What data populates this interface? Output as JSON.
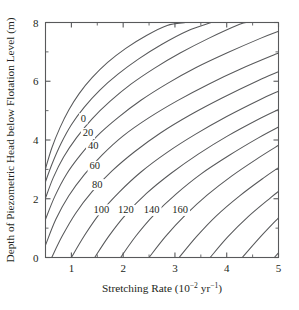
{
  "chart_data": {
    "type": "line",
    "title": "",
    "subtitle": "",
    "xlabel": "Stretching Rate (10⁻² yr⁻¹)",
    "xlabel_parts": {
      "text_main": "Stretching Rate (10",
      "exp1": "−2",
      "text_mid": " yr",
      "exp2": "−1",
      "text_end": ")"
    },
    "ylabel": "Depth of Piezometric Head below Flotation Level (m)",
    "xlim": [
      0.5,
      5.0
    ],
    "ylim": [
      0.0,
      8.0
    ],
    "x_ticks_major": [
      1,
      2,
      3,
      4,
      5
    ],
    "x_ticks_major_labels": [
      "1",
      "2",
      "3",
      "4",
      "5"
    ],
    "x_ticks_minor": [
      1.5,
      2.5,
      3.5,
      4.5
    ],
    "y_ticks_major": [
      0,
      2,
      4,
      6,
      8
    ],
    "y_ticks_major_labels": [
      "0",
      "2",
      "4",
      "6",
      "8"
    ],
    "y_ticks_minor": [
      1,
      3,
      5,
      7
    ],
    "grid": false,
    "legend": "none",
    "frame": "box-all-four-sides",
    "contour_interval": 20,
    "contour_labels": [
      "0",
      "20",
      "40",
      "60",
      "80",
      "100",
      "120",
      "140",
      "160"
    ],
    "series": [
      {
        "name": "0",
        "label": "0",
        "label_x": 1.23,
        "label_y": 4.62,
        "points": [
          [
            0.5,
            3.02
          ],
          [
            0.62,
            3.72
          ],
          [
            0.78,
            4.42
          ],
          [
            0.95,
            5.02
          ],
          [
            1.15,
            5.58
          ],
          [
            1.4,
            6.12
          ],
          [
            1.7,
            6.64
          ],
          [
            2.05,
            7.12
          ],
          [
            2.45,
            7.56
          ],
          [
            2.85,
            7.9
          ],
          [
            3.2,
            8.0
          ]
        ]
      },
      {
        "name": "20",
        "label": "20",
        "label_x": 1.32,
        "label_y": 4.12,
        "points": [
          [
            0.5,
            2.58
          ],
          [
            0.63,
            3.2
          ],
          [
            0.8,
            3.88
          ],
          [
            1.0,
            4.52
          ],
          [
            1.25,
            5.12
          ],
          [
            1.55,
            5.7
          ],
          [
            1.9,
            6.24
          ],
          [
            2.3,
            6.76
          ],
          [
            2.75,
            7.26
          ],
          [
            3.25,
            7.72
          ],
          [
            3.7,
            8.0
          ]
        ]
      },
      {
        "name": "40",
        "label": "40",
        "label_x": 1.42,
        "label_y": 3.7,
        "points": [
          [
            0.5,
            2.02
          ],
          [
            0.65,
            2.72
          ],
          [
            0.85,
            3.42
          ],
          [
            1.1,
            4.08
          ],
          [
            1.4,
            4.72
          ],
          [
            1.75,
            5.32
          ],
          [
            2.15,
            5.9
          ],
          [
            2.6,
            6.44
          ],
          [
            3.1,
            6.96
          ],
          [
            3.65,
            7.46
          ],
          [
            4.25,
            7.94
          ],
          [
            4.4,
            8.0
          ]
        ]
      },
      {
        "name": "60",
        "label": "60",
        "label_x": 1.45,
        "label_y": 3.0,
        "points": [
          [
            0.5,
            1.3
          ],
          [
            0.68,
            2.08
          ],
          [
            0.9,
            2.82
          ],
          [
            1.18,
            3.5
          ],
          [
            1.5,
            4.14
          ],
          [
            1.9,
            4.76
          ],
          [
            2.35,
            5.36
          ],
          [
            2.85,
            5.92
          ],
          [
            3.4,
            6.46
          ],
          [
            4.0,
            6.96
          ],
          [
            4.65,
            7.46
          ],
          [
            5.0,
            7.7
          ]
        ]
      },
      {
        "name": "80",
        "label": "80",
        "label_x": 1.5,
        "label_y": 2.38,
        "points": [
          [
            0.5,
            0.42
          ],
          [
            0.7,
            1.3
          ],
          [
            0.95,
            2.1
          ],
          [
            1.25,
            2.82
          ],
          [
            1.6,
            3.5
          ],
          [
            2.0,
            4.14
          ],
          [
            2.5,
            4.76
          ],
          [
            3.05,
            5.34
          ],
          [
            3.65,
            5.9
          ],
          [
            4.3,
            6.44
          ],
          [
            5.0,
            6.96
          ]
        ]
      },
      {
        "name": "100",
        "label": "100",
        "label_x": 1.58,
        "label_y": 1.52,
        "points": [
          [
            0.62,
            0.0
          ],
          [
            0.82,
            0.72
          ],
          [
            1.08,
            1.5
          ],
          [
            1.4,
            2.24
          ],
          [
            1.78,
            2.94
          ],
          [
            2.22,
            3.6
          ],
          [
            2.72,
            4.24
          ],
          [
            3.3,
            4.86
          ],
          [
            3.92,
            5.44
          ],
          [
            4.6,
            6.02
          ],
          [
            5.0,
            6.32
          ]
        ]
      },
      {
        "name": "120",
        "label": "120",
        "label_x": 2.05,
        "label_y": 1.5,
        "points": [
          [
            1.0,
            0.0
          ],
          [
            1.25,
            0.74
          ],
          [
            1.55,
            1.5
          ],
          [
            1.92,
            2.22
          ],
          [
            2.35,
            2.92
          ],
          [
            2.85,
            3.58
          ],
          [
            3.4,
            4.2
          ],
          [
            4.0,
            4.8
          ],
          [
            4.65,
            5.38
          ],
          [
            5.0,
            5.66
          ]
        ]
      },
      {
        "name": "140",
        "label": "140",
        "label_x": 2.55,
        "label_y": 1.5,
        "points": [
          [
            1.45,
            0.0
          ],
          [
            1.72,
            0.72
          ],
          [
            2.05,
            1.46
          ],
          [
            2.45,
            2.18
          ],
          [
            2.92,
            2.86
          ],
          [
            3.45,
            3.52
          ],
          [
            4.02,
            4.14
          ],
          [
            4.65,
            4.74
          ],
          [
            5.0,
            5.04
          ]
        ]
      },
      {
        "name": "160",
        "label": "160",
        "label_x": 3.1,
        "label_y": 1.5,
        "points": [
          [
            1.95,
            0.0
          ],
          [
            2.25,
            0.74
          ],
          [
            2.6,
            1.46
          ],
          [
            3.02,
            2.16
          ],
          [
            3.5,
            2.84
          ],
          [
            4.05,
            3.48
          ],
          [
            4.62,
            4.08
          ],
          [
            5.0,
            4.44
          ]
        ]
      },
      {
        "name": "180",
        "label": "",
        "label_x": null,
        "label_y": null,
        "points": [
          [
            2.5,
            0.0
          ],
          [
            2.82,
            0.72
          ],
          [
            3.2,
            1.44
          ],
          [
            3.62,
            2.12
          ],
          [
            4.1,
            2.78
          ],
          [
            4.62,
            3.4
          ],
          [
            5.0,
            3.82
          ]
        ]
      },
      {
        "name": "200",
        "label": "",
        "label_x": null,
        "label_y": null,
        "points": [
          [
            3.08,
            0.0
          ],
          [
            3.42,
            0.72
          ],
          [
            3.8,
            1.42
          ],
          [
            4.25,
            2.1
          ],
          [
            4.72,
            2.72
          ],
          [
            5.0,
            3.06
          ]
        ]
      },
      {
        "name": "220",
        "label": "",
        "label_x": null,
        "label_y": null,
        "points": [
          [
            3.68,
            0.0
          ],
          [
            4.02,
            0.7
          ],
          [
            4.42,
            1.4
          ],
          [
            4.85,
            2.04
          ],
          [
            5.0,
            2.25
          ]
        ]
      },
      {
        "name": "240",
        "label": "",
        "label_x": null,
        "label_y": null,
        "points": [
          [
            4.3,
            0.0
          ],
          [
            4.65,
            0.7
          ],
          [
            5.0,
            1.35
          ]
        ]
      },
      {
        "name": "260",
        "label": "",
        "label_x": null,
        "label_y": null,
        "points": [
          [
            4.92,
            0.0
          ],
          [
            5.0,
            0.16
          ]
        ]
      }
    ]
  },
  "colors": {
    "axis": "#58595b",
    "contour": "#58595b",
    "text": "#231f20",
    "background": "#ffffff"
  }
}
